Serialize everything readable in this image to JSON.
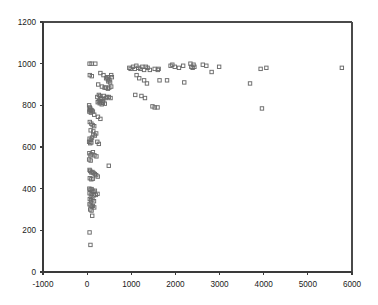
{
  "chart_data": {
    "type": "scatter",
    "title": "",
    "subtitle": "",
    "xlabel": "",
    "ylabel": "",
    "xlim": [
      -1000,
      6000
    ],
    "ylim": [
      0,
      1200
    ],
    "xticks": [
      -1000,
      0,
      1000,
      2000,
      3000,
      4000,
      5000,
      6000
    ],
    "yticks": [
      0,
      200,
      400,
      600,
      800,
      1000,
      1200
    ],
    "xtick_labels": [
      "-1000",
      "0",
      "1000",
      "2000",
      "3000",
      "4000",
      "5000",
      "6000"
    ],
    "ytick_labels": [
      "0",
      "200",
      "400",
      "600",
      "800",
      "1000",
      "1200"
    ],
    "grid": false,
    "legend": null,
    "marker": "open-square",
    "marker_color": "#6b6b6b",
    "series": [
      {
        "name": "series-1",
        "points": [
          [
            55,
            1000
          ],
          [
            100,
            1000
          ],
          [
            185,
            1000
          ],
          [
            60,
            945
          ],
          [
            105,
            940
          ],
          [
            300,
            955
          ],
          [
            370,
            945
          ],
          [
            430,
            930
          ],
          [
            455,
            935
          ],
          [
            470,
            925
          ],
          [
            480,
            915
          ],
          [
            505,
            920
          ],
          [
            520,
            910
          ],
          [
            545,
            945
          ],
          [
            560,
            935
          ],
          [
            250,
            900
          ],
          [
            335,
            890
          ],
          [
            395,
            885
          ],
          [
            430,
            885
          ],
          [
            470,
            880
          ],
          [
            500,
            885
          ],
          [
            545,
            890
          ],
          [
            955,
            980
          ],
          [
            985,
            975
          ],
          [
            1040,
            985
          ],
          [
            1080,
            975
          ],
          [
            1115,
            990
          ],
          [
            1160,
            980
          ],
          [
            1205,
            975
          ],
          [
            1250,
            985
          ],
          [
            1290,
            970
          ],
          [
            1330,
            985
          ],
          [
            1370,
            980
          ],
          [
            1420,
            970
          ],
          [
            1530,
            975
          ],
          [
            1600,
            970
          ],
          [
            1620,
            975
          ],
          [
            1890,
            990
          ],
          [
            1930,
            995
          ],
          [
            1985,
            985
          ],
          [
            2080,
            980
          ],
          [
            2175,
            990
          ],
          [
            2340,
            1000
          ],
          [
            2360,
            985
          ],
          [
            2390,
            980
          ],
          [
            2410,
            995
          ],
          [
            2430,
            985
          ],
          [
            2620,
            995
          ],
          [
            2700,
            990
          ],
          [
            2820,
            960
          ],
          [
            2990,
            985
          ],
          [
            3930,
            975
          ],
          [
            4060,
            980
          ],
          [
            5770,
            980
          ],
          [
            1120,
            945
          ],
          [
            1180,
            930
          ],
          [
            1290,
            920
          ],
          [
            1355,
            905
          ],
          [
            1640,
            920
          ],
          [
            1810,
            920
          ],
          [
            2200,
            910
          ],
          [
            3690,
            905
          ],
          [
            1090,
            850
          ],
          [
            1230,
            845
          ],
          [
            1310,
            835
          ],
          [
            1480,
            795
          ],
          [
            1530,
            790
          ],
          [
            1595,
            790
          ],
          [
            3960,
            785
          ],
          [
            230,
            840
          ],
          [
            265,
            850
          ],
          [
            290,
            845
          ],
          [
            305,
            835
          ],
          [
            320,
            830
          ],
          [
            350,
            830
          ],
          [
            365,
            820
          ],
          [
            380,
            845
          ],
          [
            420,
            835
          ],
          [
            450,
            840
          ],
          [
            490,
            840
          ],
          [
            530,
            835
          ],
          [
            240,
            815
          ],
          [
            265,
            820
          ],
          [
            285,
            810
          ],
          [
            300,
            815
          ],
          [
            330,
            805
          ],
          [
            355,
            812
          ],
          [
            400,
            808
          ],
          [
            45,
            800
          ],
          [
            60,
            790
          ],
          [
            70,
            785
          ],
          [
            55,
            780
          ],
          [
            75,
            775
          ],
          [
            90,
            778
          ],
          [
            50,
            770
          ],
          [
            85,
            765
          ],
          [
            110,
            775
          ],
          [
            130,
            770
          ],
          [
            160,
            755
          ],
          [
            245,
            745
          ],
          [
            300,
            735
          ],
          [
            60,
            720
          ],
          [
            95,
            712
          ],
          [
            125,
            705
          ],
          [
            160,
            700
          ],
          [
            80,
            680
          ],
          [
            140,
            675
          ],
          [
            55,
            640
          ],
          [
            85,
            635
          ],
          [
            110,
            645
          ],
          [
            140,
            660
          ],
          [
            175,
            655
          ],
          [
            205,
            665
          ],
          [
            45,
            625
          ],
          [
            70,
            618
          ],
          [
            95,
            622
          ],
          [
            230,
            625
          ],
          [
            265,
            615
          ],
          [
            50,
            570
          ],
          [
            75,
            560
          ],
          [
            100,
            565
          ],
          [
            130,
            575
          ],
          [
            165,
            560
          ],
          [
            210,
            555
          ],
          [
            45,
            540
          ],
          [
            80,
            535
          ],
          [
            490,
            510
          ],
          [
            55,
            490
          ],
          [
            70,
            485
          ],
          [
            95,
            478
          ],
          [
            120,
            480
          ],
          [
            145,
            475
          ],
          [
            175,
            470
          ],
          [
            205,
            465
          ],
          [
            60,
            450
          ],
          [
            95,
            445
          ],
          [
            130,
            448
          ],
          [
            240,
            458
          ],
          [
            50,
            400
          ],
          [
            75,
            395
          ],
          [
            100,
            398
          ],
          [
            120,
            390
          ],
          [
            145,
            385
          ],
          [
            175,
            390
          ],
          [
            55,
            378
          ],
          [
            85,
            372
          ],
          [
            110,
            375
          ],
          [
            150,
            368
          ],
          [
            195,
            370
          ],
          [
            235,
            375
          ],
          [
            60,
            350
          ],
          [
            90,
            345
          ],
          [
            120,
            348
          ],
          [
            155,
            340
          ],
          [
            55,
            325
          ],
          [
            80,
            320
          ],
          [
            105,
            315
          ],
          [
            130,
            318
          ],
          [
            160,
            310
          ],
          [
            70,
            300
          ],
          [
            100,
            295
          ],
          [
            115,
            270
          ],
          [
            55,
            190
          ],
          [
            75,
            130
          ]
        ]
      }
    ]
  },
  "axes": {
    "x_axis_name": "x-axis",
    "y_axis_name": "y-axis"
  }
}
